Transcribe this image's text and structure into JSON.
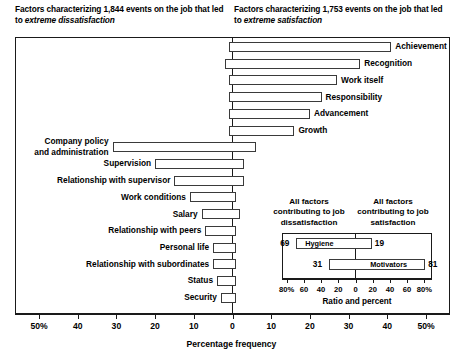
{
  "headers": {
    "left_pre": "Factors characterizing 1,844 events on the job that led to ",
    "left_em": "extreme dissatisfaction",
    "right_pre": "Factors characterizing 1,753 events on the job that led to ",
    "right_em": "extreme satisfaction"
  },
  "axis": {
    "title": "Percentage frequency",
    "ticks": [
      "50%",
      "40",
      "30",
      "20",
      "10",
      "0",
      "10",
      "20",
      "30",
      "40",
      "50%"
    ],
    "values": [
      -50,
      -40,
      -30,
      -20,
      -10,
      0,
      10,
      20,
      30,
      40,
      50
    ],
    "min": -56,
    "max": 56
  },
  "inset": {
    "header_left": "All factors contributing to job dissatisfaction",
    "header_right": "All factors contributing to job satisfaction",
    "title": "Ratio and percent",
    "ticks": [
      "80%",
      "60",
      "40",
      "20",
      "0",
      "20",
      "40",
      "60",
      "80%"
    ],
    "tick_values": [
      -80,
      -60,
      -40,
      -20,
      0,
      20,
      40,
      60,
      80
    ],
    "bars": [
      {
        "name": "Hygiene",
        "left_value": 69,
        "right_value": 19,
        "left_label": "69",
        "right_label": "19"
      },
      {
        "name": "Motivators",
        "left_value": 31,
        "right_value": 81,
        "left_label": "31",
        "right_label": "81"
      }
    ]
  },
  "chart_data": {
    "type": "bar",
    "xlabel": "Percentage frequency",
    "ylabel": "",
    "xlim": [
      -56,
      56
    ],
    "grid": false,
    "orientation": "horizontal",
    "note": "Bars extend left of zero for dissatisfaction frequency and right of zero for satisfaction frequency.",
    "categories": [
      "Achievement",
      "Recognition",
      "Work itself",
      "Responsibility",
      "Advancement",
      "Growth",
      "Company policy and administration",
      "Supervision",
      "Relationship with supervisor",
      "Work conditions",
      "Salary",
      "Relationship with peers",
      "Personal life",
      "Relationship with subordinates",
      "Status",
      "Security"
    ],
    "series": [
      {
        "name": "Dissatisfaction (left of zero)",
        "values": [
          1,
          2,
          1,
          1,
          1,
          1,
          31,
          20,
          15,
          11,
          8,
          7,
          5,
          5,
          4,
          3
        ]
      },
      {
        "name": "Satisfaction (right of zero)",
        "values": [
          41,
          33,
          27,
          23,
          20,
          16,
          6,
          3,
          3,
          1,
          2,
          1,
          1,
          1,
          1,
          1
        ]
      }
    ],
    "bars": [
      {
        "label": "Achievement",
        "group": "motivator",
        "left": 1,
        "right": 41,
        "label_side": "right",
        "label_lines": [
          "Achievement"
        ]
      },
      {
        "label": "Recognition",
        "group": "motivator",
        "left": 2,
        "right": 33,
        "label_side": "right",
        "label_lines": [
          "Recognition"
        ]
      },
      {
        "label": "Work itself",
        "group": "motivator",
        "left": 1,
        "right": 27,
        "label_side": "right",
        "label_lines": [
          "Work itself"
        ]
      },
      {
        "label": "Responsibility",
        "group": "motivator",
        "left": 1,
        "right": 23,
        "label_side": "right",
        "label_lines": [
          "Responsibility"
        ]
      },
      {
        "label": "Advancement",
        "group": "motivator",
        "left": 1,
        "right": 20,
        "label_side": "right",
        "label_lines": [
          "Advancement"
        ]
      },
      {
        "label": "Growth",
        "group": "motivator",
        "left": 1,
        "right": 16,
        "label_side": "right",
        "label_lines": [
          "Growth"
        ]
      },
      {
        "label": "Company policy and administration",
        "group": "hygiene",
        "left": 31,
        "right": 6,
        "label_side": "left",
        "label_lines": [
          "Company policy",
          "and administration"
        ]
      },
      {
        "label": "Supervision",
        "group": "hygiene",
        "left": 20,
        "right": 3,
        "label_side": "left",
        "label_lines": [
          "Supervision"
        ]
      },
      {
        "label": "Relationship with supervisor",
        "group": "hygiene",
        "left": 15,
        "right": 3,
        "label_side": "left",
        "label_lines": [
          "Relationship with supervisor"
        ]
      },
      {
        "label": "Work conditions",
        "group": "hygiene",
        "left": 11,
        "right": 1,
        "label_side": "left",
        "label_lines": [
          "Work conditions"
        ]
      },
      {
        "label": "Salary",
        "group": "hygiene",
        "left": 8,
        "right": 2,
        "label_side": "left",
        "label_lines": [
          "Salary"
        ]
      },
      {
        "label": "Relationship with peers",
        "group": "hygiene",
        "left": 7,
        "right": 1,
        "label_side": "left",
        "label_lines": [
          "Relationship with peers"
        ]
      },
      {
        "label": "Personal life",
        "group": "hygiene",
        "left": 5,
        "right": 1,
        "label_side": "left",
        "label_lines": [
          "Personal life"
        ]
      },
      {
        "label": "Relationship with subordinates",
        "group": "hygiene",
        "left": 5,
        "right": 1,
        "label_side": "left",
        "label_lines": [
          "Relationship with subordinates"
        ]
      },
      {
        "label": "Status",
        "group": "hygiene",
        "left": 4,
        "right": 1,
        "label_side": "left",
        "label_lines": [
          "Status"
        ]
      },
      {
        "label": "Security",
        "group": "hygiene",
        "left": 3,
        "right": 1,
        "label_side": "left",
        "label_lines": [
          "Security"
        ]
      }
    ],
    "inset": {
      "type": "bar",
      "title": "Ratio and percent",
      "xlim": [
        -90,
        90
      ],
      "categories": [
        "Hygiene",
        "Motivators"
      ],
      "series": [
        {
          "name": "Contributing to job dissatisfaction",
          "values": [
            69,
            31
          ]
        },
        {
          "name": "Contributing to job satisfaction",
          "values": [
            19,
            81
          ]
        }
      ]
    }
  },
  "colors": {
    "ink": "#1a1a1a",
    "bar_border": "#3a3a3a",
    "bar_fill": "#ffffff",
    "background": "#ffffff"
  }
}
